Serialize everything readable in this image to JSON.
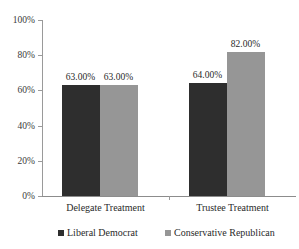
{
  "chart_data": {
    "type": "bar",
    "title": "",
    "subtitle": "",
    "xlabel": "",
    "ylabel": "",
    "categories": [
      "Delegate Treatment",
      "Trustee Treatment"
    ],
    "series": [
      {
        "name": "Liberal Democrat",
        "color": "#2e2e2e",
        "values": [
          63.0,
          64.0
        ],
        "labels": [
          "63.00%",
          "64.00%"
        ]
      },
      {
        "name": "Conservative Republican",
        "color": "#969696",
        "values": [
          63.0,
          82.0
        ],
        "labels": [
          "63.00%",
          "82.00%"
        ]
      }
    ],
    "ylim": [
      0,
      100
    ],
    "ytick_values": [
      0,
      20,
      40,
      60,
      80,
      100
    ],
    "ytick_labels": [
      "0%",
      "20%",
      "40%",
      "60%",
      "80%",
      "100%"
    ],
    "grid": false,
    "legend_position": "bottom",
    "value_labels_shown": true
  },
  "axes": {
    "y_axis_name": "percent-axis",
    "x_axis_name": "treatment-axis"
  },
  "legend": {
    "entries": [
      {
        "label": "Liberal Democrat",
        "color": "#2e2e2e"
      },
      {
        "label": "Conservative Republican",
        "color": "#969696"
      }
    ]
  }
}
